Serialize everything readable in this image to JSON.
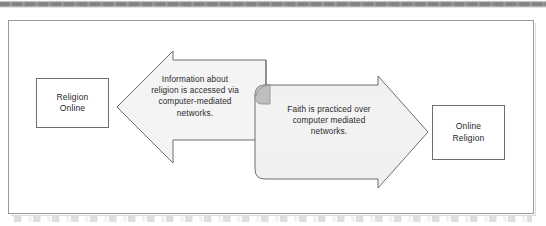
{
  "figure": {
    "type": "two-way-process-diagram"
  },
  "nodes": {
    "left_box": {
      "name": "Religion Online",
      "lines": [
        "Religion",
        "Online"
      ]
    },
    "right_box": {
      "name": "Online Religion",
      "lines": [
        "Online",
        "Religion"
      ]
    }
  },
  "arrows": [
    {
      "id": "religion-online-arrow",
      "direction": "left",
      "points_to": "Religion Online",
      "caption": "Information about religion is accessed via computer-mediated networks.",
      "caption_lines": [
        "Information about",
        "religion is accessed via",
        "computer-mediated",
        "networks."
      ],
      "fill": "#f4f4f4",
      "stroke": "#6e6e6e"
    },
    {
      "id": "online-religion-arrow",
      "direction": "right",
      "points_to": "Online Religion",
      "caption": "Faith is practiced over computer mediated networks.",
      "caption_lines": [
        "Faith is practiced over",
        "computer mediated",
        "networks."
      ],
      "fill": "#f1f1f1",
      "stroke": "#6e6e6e"
    }
  ],
  "colors": {
    "frame_border": "#9a9a9a",
    "box_border": "#6e6e6e",
    "arrow_fill_left": "#f4f4f4",
    "arrow_fill_right": "#f1f1f1",
    "arrow_stroke": "#6e6e6e",
    "curl_shadow": "#b4b4b4",
    "text": "#2b2b2b",
    "page_background": "#ffffff",
    "scan_strip": "#7e7e7e"
  }
}
